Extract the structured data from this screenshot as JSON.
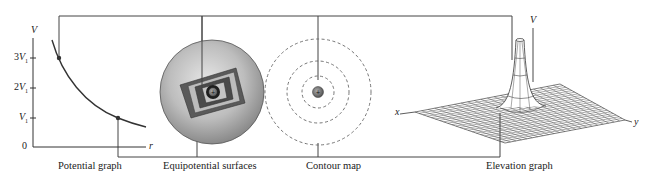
{
  "captions": {
    "potential_graph": "Potential graph",
    "equipotential_surfaces": "Equipotential surfaces",
    "contour_map": "Contour map",
    "elevation_graph": "Elevation graph"
  },
  "potential_graph": {
    "y_axis_label": "V",
    "x_axis_label": "r",
    "ticks": [
      {
        "coef": "3",
        "sym": "V",
        "sub": "1"
      },
      {
        "coef": "2",
        "sym": "V",
        "sub": "1"
      },
      {
        "coef": "",
        "sym": "V",
        "sub": "1"
      },
      {
        "coef": "0",
        "sym": "",
        "sub": ""
      }
    ]
  },
  "elevation_graph": {
    "v_axis_label": "V",
    "x_axis_label": "x",
    "y_axis_label": "y"
  },
  "charges": {
    "symbol": "+"
  },
  "colors": {
    "line": "#3a3a3a",
    "dot": "#333333",
    "sphere_light": "#d8d8d8",
    "sphere_dark": "#7a7a7a",
    "charge_fill": "#777777"
  }
}
